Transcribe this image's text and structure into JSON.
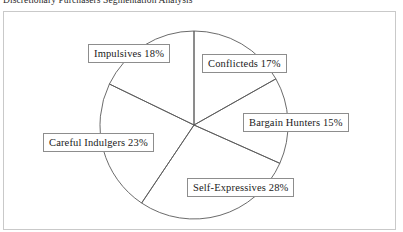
{
  "page": {
    "title": "Discretionary Purchasers Segmentation Analysis"
  },
  "chart_data": {
    "type": "pie",
    "title": "Discretionary Purchasers Segmentation Analysis",
    "xlabel": "",
    "ylabel": "",
    "legend_position": "none",
    "grid": false,
    "start_angle_deg": 0,
    "direction": "clockwise",
    "categories": [
      "Conflicteds",
      "Bargain Hunters",
      "Self-Expressives",
      "Careful Indulgers",
      "Impulsives"
    ],
    "values": [
      17,
      15,
      28,
      23,
      18
    ],
    "unit": "%",
    "slices": [
      {
        "label": "Conflicteds",
        "value": 17,
        "display": "Conflicteds 17%"
      },
      {
        "label": "Bargain Hunters",
        "value": 15,
        "display": "Bargain Hunters 15%"
      },
      {
        "label": "Self-Expressives",
        "value": 28,
        "display": "Self-Expressives 28%"
      },
      {
        "label": "Careful Indulgers",
        "value": 23,
        "display": "Careful Indulgers 23%"
      },
      {
        "label": "Impulsives",
        "value": 18,
        "display": "Impulsives 18%"
      }
    ],
    "colors": {
      "slice_stroke": "#5a5a5a",
      "slice_fill": "none",
      "label_border": "#8d8d8d",
      "label_text": "#1a1a1a",
      "frame_border": "#c9c9c9",
      "background": "#ffffff"
    }
  }
}
